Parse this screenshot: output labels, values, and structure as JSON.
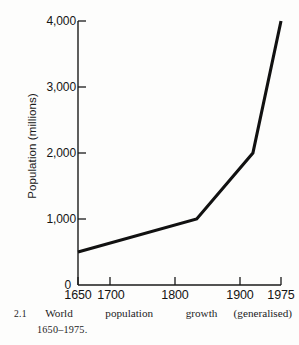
{
  "figure": {
    "number": "2.1",
    "caption_words": [
      "World",
      "population",
      "growth",
      "(generalised)"
    ],
    "caption_line2": "1650–1975."
  },
  "chart_data": {
    "type": "line",
    "title": "",
    "xlabel": "",
    "ylabel": "Population (millions)",
    "xlim": [
      1650,
      1975
    ],
    "ylim": [
      0,
      4000
    ],
    "grid": false,
    "legend": "none",
    "x_tick_values": [
      1650,
      1700,
      1800,
      1900,
      1975
    ],
    "x_tick_labels": [
      "1650",
      "1700",
      "1800",
      "1900",
      "1975"
    ],
    "y_tick_values": [
      0,
      1000,
      2000,
      3000,
      4000
    ],
    "y_tick_labels": [
      "0",
      "1,000",
      "2,000",
      "3,000",
      "4,000"
    ],
    "series": [
      {
        "name": "World population",
        "color": "#111111",
        "x": [
          1650,
          1840,
          1930,
          1975
        ],
        "y": [
          500,
          1000,
          2000,
          4000
        ]
      }
    ]
  },
  "colors": {
    "line": "#111111",
    "axis": "#1a1a1a",
    "text": "#141414",
    "background": "#fdfdfc"
  }
}
